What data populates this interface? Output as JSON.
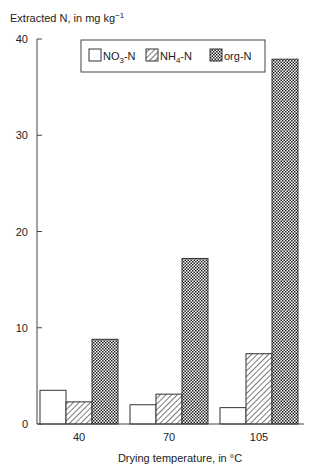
{
  "chart_data": {
    "type": "bar",
    "title": "",
    "ylabel": "Extracted N, in mg kg",
    "ylabel_superscript": "−1",
    "xlabel": "Drying temperature, in °C",
    "categories": [
      "40",
      "70",
      "105"
    ],
    "series": [
      {
        "name": "NO3-N",
        "name_base": "NO",
        "name_sub": "3",
        "name_suffix": "-N",
        "pattern": "open",
        "values": [
          3.5,
          2.0,
          1.7
        ]
      },
      {
        "name": "NH4-N",
        "name_base": "NH",
        "name_sub": "4",
        "name_suffix": "-N",
        "pattern": "hatch",
        "values": [
          2.3,
          3.1,
          7.3
        ]
      },
      {
        "name": "org-N",
        "name_base": "org-N",
        "name_sub": "",
        "name_suffix": "",
        "pattern": "crosshatch",
        "values": [
          8.8,
          17.2,
          37.9
        ]
      }
    ],
    "ylim": [
      0,
      40
    ],
    "yticks": [
      0,
      10,
      20,
      30,
      40
    ],
    "grid": false,
    "legend_position": "top-inside"
  }
}
